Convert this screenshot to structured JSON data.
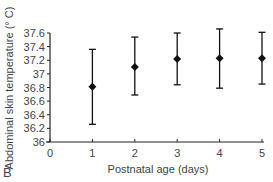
{
  "chart_data": {
    "type": "scatter",
    "subtype": "error-bar",
    "title": "",
    "panel_label": "B",
    "xlabel": "Postnatal age (days)",
    "ylabel": "Abdominal skin temperature (° C)",
    "x_ticks": [
      0,
      1,
      2,
      3,
      4,
      5
    ],
    "y_ticks": [
      "36",
      "36.2",
      "36.4",
      "36.6",
      "36.8",
      "37",
      "37.2",
      "37.4",
      "37.6"
    ],
    "xlim": [
      0,
      5
    ],
    "ylim": [
      36,
      37.6
    ],
    "grid": false,
    "legend": null,
    "series": [
      {
        "name": "Abdominal skin temperature",
        "marker": "diamond",
        "color": "#111111",
        "x": [
          1,
          2,
          3,
          4,
          5
        ],
        "y": [
          36.81,
          37.1,
          37.22,
          37.23,
          37.23
        ],
        "y_upper": [
          37.36,
          37.54,
          37.6,
          37.66,
          37.61
        ],
        "y_lower": [
          36.26,
          36.69,
          36.84,
          36.79,
          36.85
        ]
      }
    ]
  }
}
